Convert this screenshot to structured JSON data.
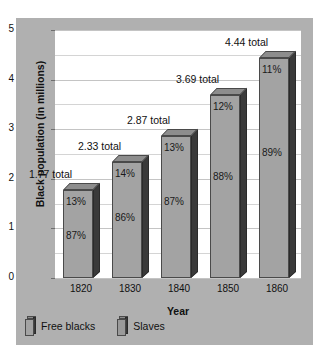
{
  "chart_data": {
    "type": "bar",
    "title": "",
    "xlabel": "Year",
    "ylabel": "Black population (in millions)",
    "categories": [
      "1820",
      "1830",
      "1840",
      "1850",
      "1860"
    ],
    "values": [
      1.77,
      2.33,
      2.87,
      3.69,
      4.44
    ],
    "total_labels": [
      "1.77 total",
      "2.33 total",
      "2.87 total",
      "3.69 total",
      "4.44 total"
    ],
    "series": [
      {
        "name": "Free blacks",
        "percent_labels": [
          "13%",
          "14%",
          "13%",
          "12%",
          "11%"
        ]
      },
      {
        "name": "Slaves",
        "percent_labels": [
          "87%",
          "86%",
          "87%",
          "88%",
          "89%"
        ]
      }
    ],
    "ylim": [
      0,
      5
    ],
    "ytick_labels": [
      "0",
      "1",
      "2",
      "3",
      "4",
      "5"
    ],
    "gridlines": [
      0,
      0.5,
      1,
      1.5,
      2,
      2.5,
      3,
      3.5,
      4,
      4.5,
      5
    ],
    "grid": true,
    "legend_position": "bottom-left",
    "colors": {
      "panel": "#b0b0b0",
      "plot_background": "#ffffff",
      "bar_front": "#a3a3a3",
      "bar_top": "#8d8d8d",
      "bar_side": "#3a3a3a",
      "gridline": "#d4d4d4",
      "text": "#111111"
    }
  },
  "legend": {
    "items": [
      {
        "label": "Free blacks"
      },
      {
        "label": "Slaves"
      }
    ]
  }
}
